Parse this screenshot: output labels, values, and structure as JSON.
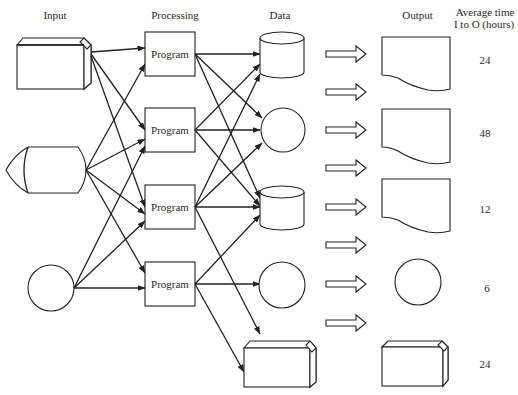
{
  "headers": {
    "input": "Input",
    "processing": "Processing",
    "data": "Data",
    "output": "Output",
    "average_time_line1": "Average time",
    "average_time_line2": "I to O (hours)"
  },
  "inputs": [
    {
      "shape": "punched-card-box",
      "name": "input-card"
    },
    {
      "shape": "display",
      "name": "input-display"
    },
    {
      "shape": "circle",
      "name": "input-circle"
    }
  ],
  "programs": [
    {
      "label": "Program"
    },
    {
      "label": "Program"
    },
    {
      "label": "Program"
    },
    {
      "label": "Program"
    }
  ],
  "data_stores": [
    {
      "shape": "cylinder"
    },
    {
      "shape": "circle"
    },
    {
      "shape": "cylinder"
    },
    {
      "shape": "circle"
    },
    {
      "shape": "card-box"
    }
  ],
  "block_arrows_count": 8,
  "outputs": [
    {
      "shape": "document",
      "time": "24"
    },
    {
      "shape": "document",
      "time": "48"
    },
    {
      "shape": "document",
      "time": "12"
    },
    {
      "shape": "circle",
      "time": "6"
    },
    {
      "shape": "card-box",
      "time": "24"
    }
  ],
  "connections": {
    "input_to_program": [
      [
        0,
        0
      ],
      [
        0,
        1
      ],
      [
        0,
        2
      ],
      [
        1,
        0
      ],
      [
        1,
        1
      ],
      [
        1,
        2
      ],
      [
        1,
        3
      ],
      [
        2,
        1
      ],
      [
        2,
        2
      ],
      [
        2,
        3
      ]
    ],
    "program_to_data": [
      [
        0,
        0
      ],
      [
        0,
        1
      ],
      [
        0,
        2
      ],
      [
        1,
        0
      ],
      [
        1,
        1
      ],
      [
        1,
        2
      ],
      [
        2,
        0
      ],
      [
        2,
        1
      ],
      [
        2,
        2
      ],
      [
        2,
        4
      ],
      [
        3,
        2
      ],
      [
        3,
        3
      ],
      [
        3,
        4
      ]
    ]
  }
}
